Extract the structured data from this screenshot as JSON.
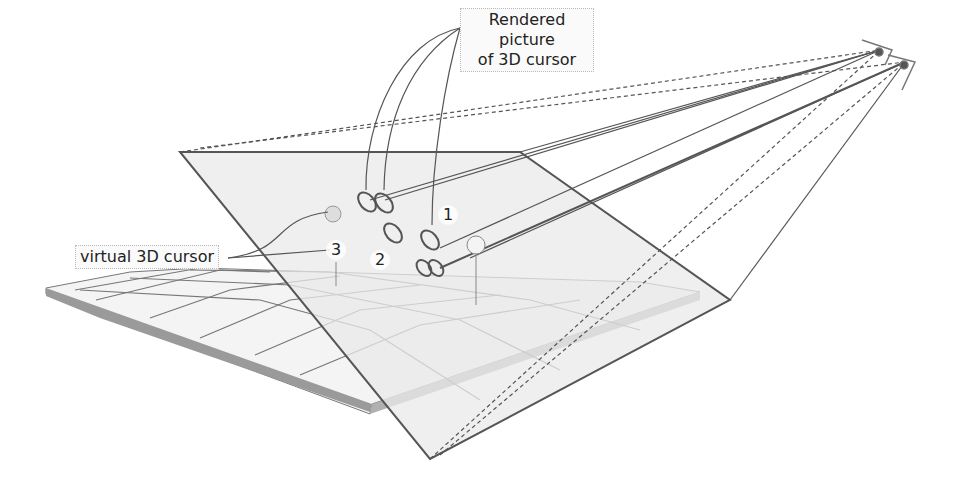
{
  "diagram": {
    "labels": {
      "rendered_picture": "Rendered picture of 3D cursor",
      "rendered_line1": "Rendered picture",
      "rendered_line2": "of 3D cursor",
      "virtual_cursor": "virtual 3D cursor"
    },
    "markers": [
      "1",
      "2",
      "3"
    ],
    "elements": [
      "terrain surface with grid",
      "projection image plane",
      "two camera/eye viewpoints",
      "sight rays (solid and dashed)",
      "rendered cursor ellipse pairs",
      "virtual 3D cursor spheres"
    ],
    "colors": {
      "line": "#555555",
      "plane": "#e8e8e8",
      "terrain_side": "#9a9a9a"
    }
  }
}
